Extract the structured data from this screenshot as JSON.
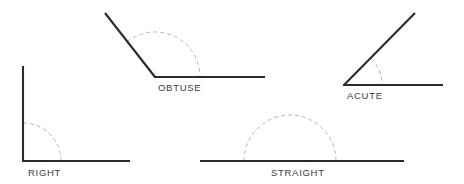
{
  "diagram": {
    "background_color": "#ffffff",
    "line_color": "#2b2b2f",
    "arc_color": "#b9b5b8",
    "label_color": "#3a3a3e",
    "angles": [
      {
        "id": "right",
        "label": "RIGHT",
        "measure_degrees": 90,
        "vertex": {
          "x": 23,
          "y": 161
        },
        "rays": [
          {
            "name": "vertical-ray",
            "x1": 23,
            "y1": 161,
            "x2": 23,
            "y2": 66
          },
          {
            "name": "horizontal-ray",
            "x1": 23,
            "y1": 161,
            "x2": 130,
            "y2": 161
          }
        ],
        "arc": {
          "radius": 38,
          "start_angle": 90,
          "end_angle": 0
        },
        "label_pos": {
          "x": 28,
          "y": 175
        }
      },
      {
        "id": "obtuse",
        "label": "OBTUSE",
        "measure_degrees": 135,
        "vertex": {
          "x": 155,
          "y": 77
        },
        "rays": [
          {
            "name": "slanted-ray",
            "x1": 155,
            "y1": 77,
            "x2": 105,
            "y2": 13
          },
          {
            "name": "horizontal-ray",
            "x1": 155,
            "y1": 77,
            "x2": 265,
            "y2": 77
          }
        ],
        "arc": {
          "radius": 45,
          "start_angle": 128,
          "end_angle": 0
        },
        "label_pos": {
          "x": 158,
          "y": 91
        }
      },
      {
        "id": "acute",
        "label": "ACUTE",
        "measure_degrees": 42,
        "vertex": {
          "x": 344,
          "y": 85
        },
        "rays": [
          {
            "name": "slanted-ray",
            "x1": 344,
            "y1": 85,
            "x2": 415,
            "y2": 13
          },
          {
            "name": "horizontal-ray",
            "x1": 344,
            "y1": 85,
            "x2": 443,
            "y2": 85
          }
        ],
        "arc": {
          "radius": 38,
          "start_angle": 45,
          "end_angle": 0
        },
        "label_pos": {
          "x": 347,
          "y": 99
        }
      },
      {
        "id": "straight",
        "label": "STRAIGHT",
        "measure_degrees": 180,
        "vertex": {
          "x": 290,
          "y": 161
        },
        "rays": [
          {
            "name": "horizontal-line",
            "x1": 200,
            "y1": 161,
            "x2": 404,
            "y2": 161
          }
        ],
        "arc": {
          "radius": 46,
          "start_angle": 180,
          "end_angle": 0
        },
        "label_pos": {
          "x": 271,
          "y": 176
        }
      }
    ]
  }
}
